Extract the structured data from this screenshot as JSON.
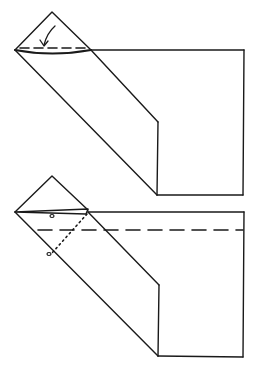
{
  "diagram": {
    "type": "origami-folding-steps",
    "stroke_color": "#1a1a1a",
    "background": "#ffffff",
    "steps": [
      {
        "name": "step-1",
        "description": "Fold the top triangular flap down along the dashed valley line",
        "symbols": [
          "valley-fold-dashed-line",
          "curved-fold-arrow"
        ]
      },
      {
        "name": "step-2",
        "description": "Dotted line connects two reference dots; dashed valley fold line across paper",
        "symbols": [
          "reference-dot",
          "reference-dot",
          "dotted-guide-line",
          "valley-fold-dashed-line"
        ]
      }
    ]
  }
}
